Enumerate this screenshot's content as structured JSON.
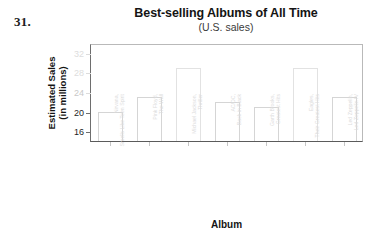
{
  "problem": {
    "number": "31."
  },
  "chart_data": {
    "type": "bar",
    "title": "Best-selling Albums of All Time",
    "subtitle": "(U.S. sales)",
    "xlabel": "Album",
    "ylabel_line1": "Estimated Sales",
    "ylabel_line2": "(in millions)",
    "ylim": [
      14,
      34
    ],
    "grid": false,
    "legend": null,
    "yticks": [
      {
        "value": 32,
        "label": "32",
        "visibility": "faded"
      },
      {
        "value": 28,
        "label": "28",
        "visibility": "faded"
      },
      {
        "value": 24,
        "label": "24",
        "visibility": "faded"
      },
      {
        "value": 20,
        "label": "20",
        "visibility": "visible"
      },
      {
        "value": 16,
        "label": "16",
        "visibility": "visible"
      }
    ],
    "categories": [
      "Nirvana, Smells Like Teen Spirit",
      "Pink Floyd, The Wall",
      "Michael Jackson, Thriller",
      "AC/DC, Back in Black",
      "Garth Brooks, Greatest Hits",
      "Eagles, Their Greatest Hits",
      "Led Zeppelin, Led Zeppelin IV"
    ],
    "values": [
      20,
      23,
      29,
      22,
      21,
      29,
      23
    ]
  }
}
